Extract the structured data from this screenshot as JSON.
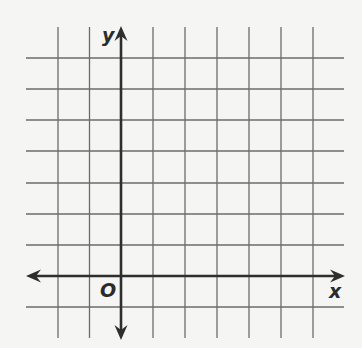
{
  "diagram": {
    "type": "coordinate-grid",
    "x_axis_label": "x",
    "y_axis_label": "y",
    "origin_label": "O",
    "grid": {
      "columns": 10,
      "rows": 10,
      "origin_column": 3,
      "origin_row_from_top": 8,
      "x_range": [
        -3,
        7
      ],
      "y_range": [
        -2,
        8
      ]
    },
    "colors": {
      "background": "#f5f5f3",
      "grid_line": "#6b6b6b",
      "axis": "#2e2e2e",
      "label": "#2b2b2b"
    }
  }
}
